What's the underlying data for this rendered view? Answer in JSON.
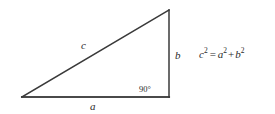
{
  "figure": {
    "type": "right-triangle-diagram",
    "background_color": "#ffffff",
    "stroke_color": "#3a3a3a",
    "text_color": "#2b2b2b"
  },
  "labels": {
    "hypotenuse": "c",
    "base": "a",
    "vertical": "b",
    "right_angle": "90°"
  },
  "equation": {
    "lhs_var": "c",
    "lhs_exp": "2",
    "equals": "=",
    "term1_var": "a",
    "term1_exp": "2",
    "plus": "+",
    "term2_var": "b",
    "term2_exp": "2",
    "full_text": "c² = a² + b²"
  },
  "geometry": {
    "vertex_left": [
      22,
      97
    ],
    "vertex_right": [
      169,
      97
    ],
    "vertex_apex": [
      169,
      10
    ]
  }
}
